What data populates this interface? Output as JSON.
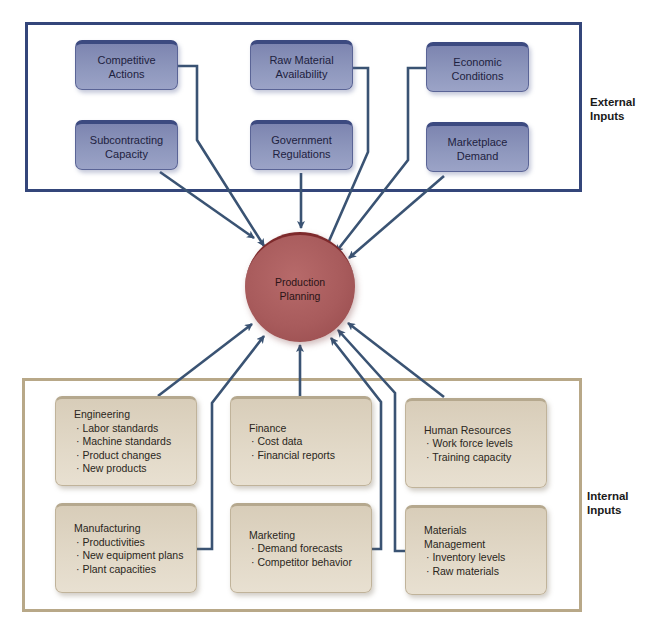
{
  "diagram": {
    "center": {
      "label_line1": "Production",
      "label_line2": "Planning",
      "color": "#a85b5c"
    },
    "external": {
      "group_label_line1": "External",
      "group_label_line2": "Inputs",
      "frame_color": "#34467a",
      "box_color": "#8e97bd",
      "boxes": [
        {
          "line1": "Competitive",
          "line2": "Actions"
        },
        {
          "line1": "Raw Material",
          "line2": "Availability"
        },
        {
          "line1": "Economic",
          "line2": "Conditions"
        },
        {
          "line1": "Subcontracting",
          "line2": "Capacity"
        },
        {
          "line1": "Government",
          "line2": "Regulations"
        },
        {
          "line1": "Marketplace",
          "line2": "Demand"
        }
      ]
    },
    "internal": {
      "group_label_line1": "Internal",
      "group_label_line2": "Inputs",
      "frame_color": "#b8a888",
      "box_color": "#e2d9c8",
      "boxes": [
        {
          "title": "Engineering",
          "items": [
            "· Labor standards",
            "· Machine standards",
            "· Product changes",
            "· New products"
          ]
        },
        {
          "title": "Finance",
          "items": [
            "· Cost data",
            "· Financial reports"
          ]
        },
        {
          "title": "Human Resources",
          "items": [
            "· Work force levels",
            "· Training capacity"
          ]
        },
        {
          "title": "Manufacturing",
          "items": [
            "· Productivities",
            "· New equipment plans",
            "· Plant capacities"
          ]
        },
        {
          "title": "Marketing",
          "items": [
            "· Demand forecasts",
            "· Competitor behavior"
          ]
        },
        {
          "title_line1": "Materials",
          "title": "Management",
          "items": [
            "· Inventory levels",
            "· Raw materials"
          ]
        }
      ]
    },
    "arrow_color": "#3a5373"
  }
}
